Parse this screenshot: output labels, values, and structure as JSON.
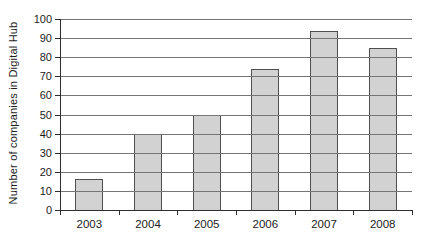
{
  "chart_data": {
    "type": "bar",
    "categories": [
      "2003",
      "2004",
      "2005",
      "2006",
      "2007",
      "2008"
    ],
    "values": [
      16,
      40,
      50,
      74,
      94,
      85
    ],
    "title": "",
    "xlabel": "",
    "ylabel": "Number of companies in Digital Hub",
    "ylim": [
      0,
      100
    ],
    "ytick_step": 10,
    "grid": true,
    "legend": false,
    "gridlines_over_bars": true,
    "colors": {
      "background": "#ffffff",
      "bar_fill": "#d2d2d2",
      "bar_border": "#4f4f4f",
      "gridline": "#757575",
      "axis": "#2e2e2e",
      "text": "#1c1c1c"
    }
  }
}
